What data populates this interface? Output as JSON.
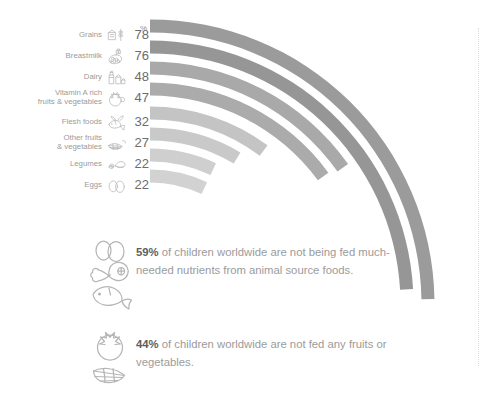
{
  "chart_data": {
    "type": "bar",
    "title": "",
    "subtitle": "",
    "xlabel": "",
    "ylabel": "",
    "unit_header": "%",
    "grid": false,
    "legend": "none",
    "orientation": "horizontal-arc",
    "xlim": [
      0,
      100
    ],
    "categories": [
      "Grains",
      "Breastmilk",
      "Dairy",
      "Vitamin A rich\nfruits & vegetables",
      "Flesh foods",
      "Other fruits\n& vegetables",
      "Legumes",
      "Eggs"
    ],
    "values": [
      78,
      76,
      48,
      47,
      32,
      27,
      22,
      22
    ],
    "value_labels": [
      "78",
      "76",
      "48",
      "47",
      "32",
      "27",
      "22",
      "22"
    ],
    "bar_colors": [
      "#9b9b9b",
      "#969696",
      "#a9a9a9",
      "#ababab",
      "#c4c4c4",
      "#c9c9c9",
      "#cfcfcf",
      "#d2d2d2"
    ],
    "icons": [
      "grains-icon",
      "breastmilk-icon",
      "dairy-icon",
      "vitamin-a-fruits-vegetables-icon",
      "flesh-foods-icon",
      "other-fruits-vegetables-icon",
      "legumes-icon",
      "eggs-icon"
    ]
  },
  "chart": {
    "unit_header": "%",
    "rows": [
      {
        "label": "Grains",
        "value": "78",
        "icon": "grains-icon"
      },
      {
        "label": "Breastmilk",
        "value": "76",
        "icon": "breastmilk-icon"
      },
      {
        "label": "Dairy",
        "value": "48",
        "icon": "dairy-icon"
      },
      {
        "label": "Vitamin A rich\nfruits & vegetables",
        "value": "47",
        "icon": "vitamin-a-fruits-vegetables-icon"
      },
      {
        "label": "Flesh foods",
        "value": "32",
        "icon": "flesh-foods-icon"
      },
      {
        "label": "Other fruits\n& vegetables",
        "value": "27",
        "icon": "other-fruits-vegetables-icon"
      },
      {
        "label": "Legumes",
        "value": "22",
        "icon": "legumes-icon"
      },
      {
        "label": "Eggs",
        "value": "22",
        "icon": "eggs-icon"
      }
    ]
  },
  "facts": [
    {
      "icon": "animal-source-foods-icon",
      "highlight": "59%",
      "text": " of children worldwide are not being fed much-needed nutrients from animal source foods."
    },
    {
      "icon": "fruits-vegetables-icon",
      "highlight": "44%",
      "text": " of children worldwide are not fed any fruits or vegetables."
    }
  ],
  "colors": {
    "label_text": "#9a9a9a",
    "value_text": "#6d6d6d",
    "fact_text": "#9b9b9b",
    "fact_highlight": "#5e5e5e",
    "icon_stroke": "#b5b5b5",
    "dotted_rule": "#dcdcdc",
    "background": "#ffffff"
  }
}
